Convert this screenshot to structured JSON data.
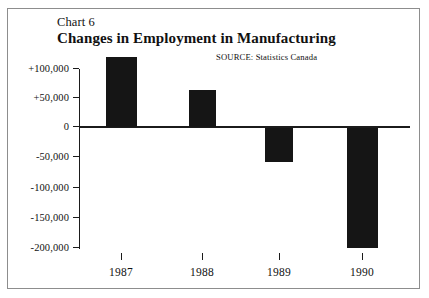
{
  "figure": {
    "chart_label": "Chart 6",
    "title": "Changes in Employment in Manufacturing",
    "source": "SOURCE:  Statistics Canada",
    "frame_color": "#8d8d8d",
    "bar_color": "#151515",
    "axis_color": "#1b1b1b",
    "background": "#ffffff"
  },
  "chart_data": {
    "type": "bar",
    "title": "Changes in Employment in Manufacturing",
    "subtitle": "Chart 6",
    "annotations": [
      "SOURCE:  Statistics Canada"
    ],
    "xlabel": "",
    "ylabel": "",
    "categories": [
      "1987",
      "1988",
      "1989",
      "1990"
    ],
    "values": [
      120000,
      62000,
      -57000,
      -200000
    ],
    "ylim": [
      -200000,
      100000
    ],
    "yticks": [
      100000,
      50000,
      0,
      -50000,
      -100000,
      -150000,
      -200000
    ],
    "ytick_labels": [
      "+100,000",
      "+50,000",
      "0",
      "-50,000",
      "-100,000",
      "-150,000",
      "-200,000"
    ],
    "grid": false,
    "legend": null,
    "series": [
      {
        "name": "Change in manufacturing employment",
        "values": [
          120000,
          62000,
          -57000,
          -200000
        ]
      }
    ]
  },
  "axis": {
    "y_ticks": [
      {
        "label": "+100,000",
        "value": 100000,
        "y": 68
      },
      {
        "label": "+50,000",
        "value": 50000,
        "y": 97
      },
      {
        "label": "0",
        "value": 0,
        "y": 126
      },
      {
        "label": "-50,000",
        "value": -50000,
        "y": 156
      },
      {
        "label": "-100,000",
        "value": -100000,
        "y": 187
      },
      {
        "label": "-150,000",
        "value": -150000,
        "y": 217
      },
      {
        "label": "-200,000",
        "value": -200000,
        "y": 247
      }
    ],
    "x_items": [
      {
        "label": "1987",
        "tick_x": 121,
        "bar_left": 106,
        "bar_width": 31,
        "bar_top": 57,
        "bar_height": 70
      },
      {
        "label": "1988",
        "tick_x": 202,
        "bar_left": 189,
        "bar_width": 27,
        "bar_top": 90,
        "bar_height": 37
      },
      {
        "label": "1989",
        "tick_x": 279,
        "bar_left": 265,
        "bar_width": 28,
        "bar_top": 128,
        "bar_height": 34
      },
      {
        "label": "1990",
        "tick_x": 362,
        "bar_left": 347,
        "bar_width": 31,
        "bar_top": 128,
        "bar_height": 120
      }
    ]
  }
}
